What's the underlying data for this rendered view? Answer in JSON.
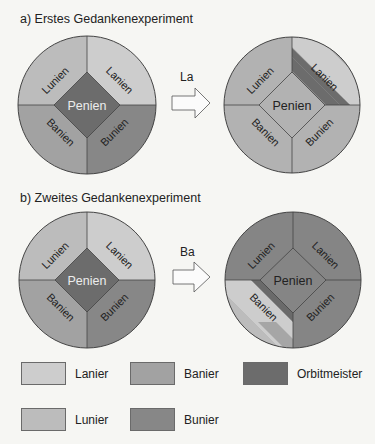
{
  "experiments": [
    {
      "caption": "a) Erstes Gedankenexperiment",
      "arrow_label": "La",
      "before": {
        "quadrants": {
          "tl": "Lunien",
          "tr": "Lanien",
          "bl": "Banien",
          "br": "Bunien"
        },
        "center": "Penien"
      },
      "after": {
        "quadrants": {
          "tl": "Lunien",
          "tr": "Lanien",
          "bl": "Banien",
          "br": "Bunien"
        },
        "center": "Penien"
      }
    },
    {
      "caption": "b) Zweites Gedankenexperiment",
      "arrow_label": "Ba",
      "before": {
        "quadrants": {
          "tl": "Lunien",
          "tr": "Lanien",
          "bl": "Banien",
          "br": "Bunien"
        },
        "center": "Penien"
      },
      "after": {
        "quadrants": {
          "tl": "Lunien",
          "tr": "Lanien",
          "bl": "Banien",
          "br": "Bunien"
        },
        "center": "Penien"
      }
    }
  ],
  "legend": [
    {
      "label": "Lanier",
      "color": "#cdcdcd"
    },
    {
      "label": "Banier",
      "color": "#a2a2a2"
    },
    {
      "label": "Orbitmeister",
      "color": "#6c6c6c"
    },
    {
      "label": "Lunier",
      "color": "#bcbcbc"
    },
    {
      "label": "Bunier",
      "color": "#878787"
    }
  ]
}
